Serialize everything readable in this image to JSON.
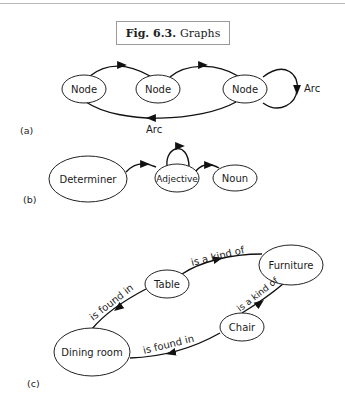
{
  "caption": {
    "fig_label": "Fig. 6.3.",
    "title": "Graphs"
  },
  "panels": {
    "a": {
      "label": "(a)",
      "nodes": [
        "Node",
        "Node",
        "Node"
      ],
      "arc_labels": [
        "Arc",
        "Arc"
      ]
    },
    "b": {
      "label": "(b)",
      "nodes": [
        "Determiner",
        "Adjective",
        "Noun"
      ]
    },
    "c": {
      "label": "(c)",
      "nodes": [
        "Table",
        "Furniture",
        "Chair",
        "Dining room"
      ],
      "edge_labels": [
        "is a kind of",
        "is found in",
        "is a kind of",
        "is found in"
      ]
    }
  }
}
